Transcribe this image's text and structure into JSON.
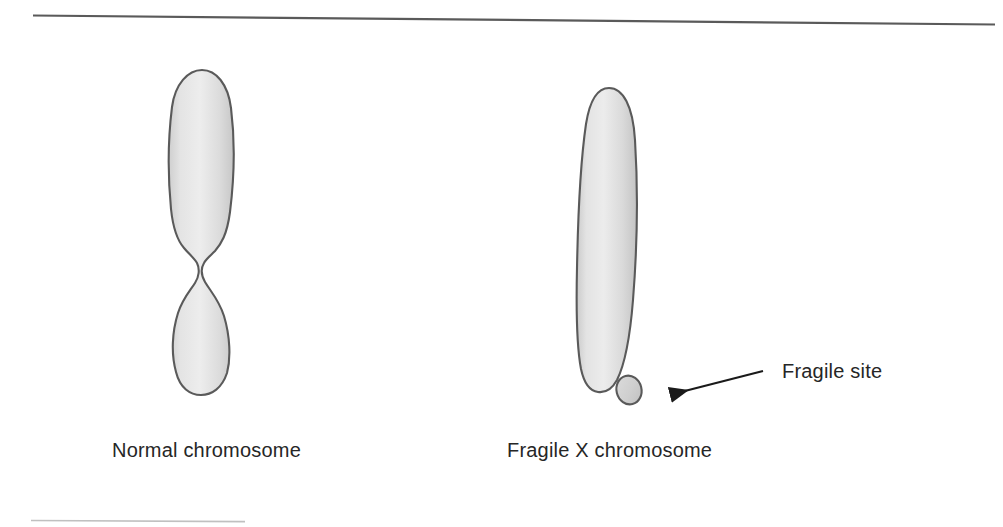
{
  "figure": {
    "title_text": "",
    "background_color": "#ffffff",
    "width": 1003,
    "height": 527
  },
  "rules": {
    "top_rule_name": "top-horizontal-rule",
    "top_rule_color": "#555555",
    "bottom_rule_name": "bottom-horizontal-rule",
    "bottom_rule_color": "#b8b8b8"
  },
  "diagram": {
    "chromosome_fill_light": "#e8e8e8",
    "chromosome_fill_mid": "#d8d8d8",
    "chromosome_fill_dark": "#c6c6c6",
    "chromosome_outline": "#5a5a5a",
    "arrow_color": "#1a1a1a"
  },
  "labels": {
    "normal_chromosome": "Normal chromosome",
    "fragile_x_chromosome": "Fragile X chromosome",
    "fragile_site": "Fragile site"
  },
  "shapes": {
    "normal_chromosome_name": "normal-chromosome-shape",
    "fragile_x_body_name": "fragile-x-chromosome-shape",
    "fragile_site_nodule_name": "fragile-site-nodule-shape",
    "arrow_name": "fragile-site-arrow"
  }
}
